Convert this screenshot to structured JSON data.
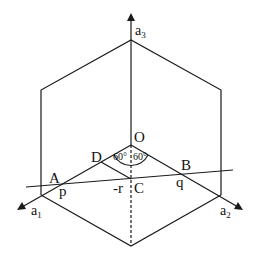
{
  "diagram": {
    "axes": {
      "a1": {
        "label": "a",
        "sub": "1"
      },
      "a2": {
        "label": "a",
        "sub": "2"
      },
      "a3": {
        "label": "a",
        "sub": "3"
      }
    },
    "points": {
      "O": "O",
      "A": "A",
      "B": "B",
      "C": "C",
      "D": "D"
    },
    "intercepts": {
      "p": "p",
      "q": "q",
      "r": "-r"
    },
    "angles": {
      "left": "60°",
      "right": "60°"
    },
    "colors": {
      "line": "#1a1a1a",
      "background": "#ffffff"
    }
  }
}
